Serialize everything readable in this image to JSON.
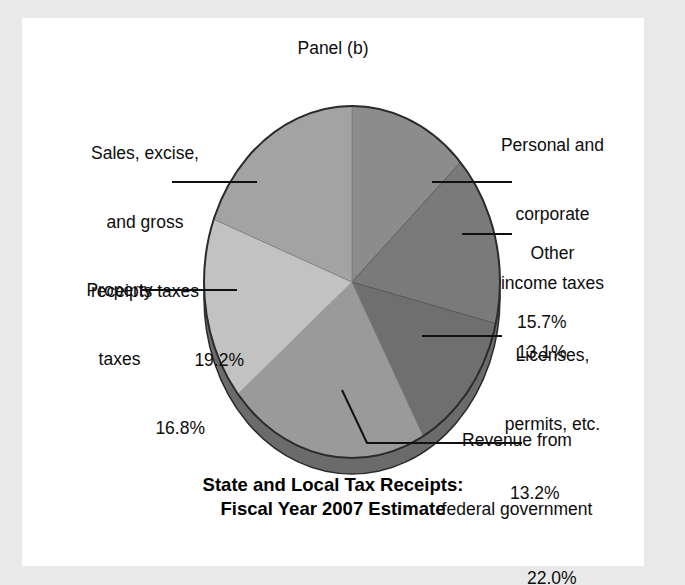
{
  "figure": {
    "panel_caption": "Panel (b)",
    "title_line1": "State and Local Tax Receipts:",
    "title_line2": "Fiscal Year 2007 Estimate"
  },
  "labels": {
    "sales": {
      "l1": "Sales, excise,",
      "l2": "and gross",
      "l3": "receipts taxes",
      "value": "19.2%"
    },
    "property": {
      "l1": "Property",
      "l2": "taxes",
      "value": "16.8%"
    },
    "income": {
      "l1": "Personal and",
      "l2": "corporate",
      "l3": "income taxes",
      "value": "13.1%"
    },
    "other": {
      "l1": "Other",
      "value": "15.7%"
    },
    "licenses": {
      "l1": "Licenses,",
      "l2": "permits, etc.",
      "value": "13.2%"
    },
    "federal": {
      "l1": "Revenue from",
      "l2": "federal government",
      "value": "22.0%"
    }
  },
  "chart_data": {
    "type": "pie",
    "title": "State and Local Tax Receipts: Fiscal Year 2007 Estimate",
    "subtitle": "Panel (b)",
    "unit": "percent",
    "total": 100.0,
    "legend_position": "callout-labels",
    "categories": [
      "Personal and corporate income taxes",
      "Other",
      "Licenses, permits, etc.",
      "Revenue from federal government",
      "Property taxes",
      "Sales, excise, and gross receipts taxes"
    ],
    "values": [
      13.1,
      15.7,
      13.2,
      22.0,
      16.8,
      19.2
    ],
    "slice_colors": [
      "#8c8c8c",
      "#7a7a7a",
      "#6f6f6f",
      "#9a9a9a",
      "#c2c2c2",
      "#a3a3a3"
    ],
    "slices": [
      {
        "label": "Personal and corporate income taxes",
        "value": 13.1,
        "color": "#8c8c8c"
      },
      {
        "label": "Other",
        "value": 15.7,
        "color": "#7a7a7a"
      },
      {
        "label": "Licenses, permits, etc.",
        "value": 13.2,
        "color": "#6f6f6f"
      },
      {
        "label": "Revenue from federal government",
        "value": 22.0,
        "color": "#9a9a9a"
      },
      {
        "label": "Property taxes",
        "value": 16.8,
        "color": "#c2c2c2"
      },
      {
        "label": "Sales, excise, and gross receipts taxes",
        "value": 19.2,
        "color": "#a3a3a3"
      }
    ]
  },
  "colors": {
    "page_margin": "#e9e9e9",
    "figure_background": "#ffffff",
    "pie_side_wall": "#6b6b6b",
    "pie_outline": "#2b2b2b",
    "text": "#0d0d0d"
  }
}
